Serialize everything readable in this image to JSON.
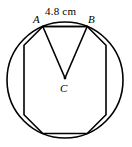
{
  "figure": {
    "labels": {
      "vertex_a": "A",
      "vertex_b": "B",
      "center": "C",
      "side_length": "4.8 cm"
    },
    "stroke_color": "#000000",
    "background_color": "#ffffff"
  },
  "chart_data": {
    "type": "diagram",
    "shape": "regular-octagon-in-circle",
    "sides": 8,
    "circle": {
      "center_x": 65,
      "center_y": 80,
      "radius": 58,
      "stroke_width": 1.6
    },
    "octagon": {
      "vertices": [
        {
          "name": "A",
          "x": 42.8,
          "y": 26.5
        },
        {
          "name": "B",
          "x": 87.2,
          "y": 26.5
        },
        {
          "name": "",
          "x": 106.0,
          "y": 45.3
        },
        {
          "name": "",
          "x": 106.0,
          "y": 114.7
        },
        {
          "name": "",
          "x": 87.2,
          "y": 133.5
        },
        {
          "name": "",
          "x": 42.8,
          "y": 133.5
        },
        {
          "name": "",
          "x": 24.0,
          "y": 114.7
        },
        {
          "name": "",
          "x": 24.0,
          "y": 45.3
        }
      ],
      "stroke_width": 1.6
    },
    "triangle": {
      "points": [
        {
          "name": "A",
          "x": 42.8,
          "y": 26.5
        },
        {
          "name": "B",
          "x": 87.2,
          "y": 26.5
        },
        {
          "name": "C",
          "x": 65.0,
          "y": 78.0
        }
      ],
      "stroke_width": 1.6
    },
    "center_dot": {
      "x": 65,
      "y": 78,
      "r": 1.4
    },
    "annotations": [
      {
        "text": "4.8 cm",
        "x": 45,
        "y": 6,
        "target": "side AB"
      },
      {
        "text": "A",
        "x": 33,
        "y": 14,
        "target": "vertex A"
      },
      {
        "text": "B",
        "x": 88,
        "y": 14,
        "target": "vertex B"
      },
      {
        "text": "C",
        "x": 60,
        "y": 83,
        "target": "center C"
      }
    ]
  }
}
